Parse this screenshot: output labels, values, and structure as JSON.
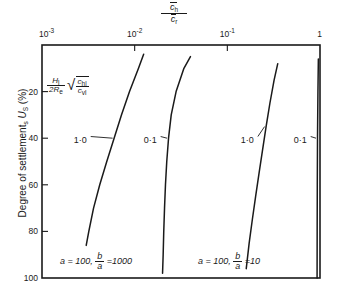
{
  "chart_data": {
    "type": "line",
    "title": "",
    "xlabel": "c̄h / c̄r",
    "xlabel_parts": {
      "numerator": "ch",
      "denominator": "cr"
    },
    "ylabel": "Degree of settlement, Us (%)",
    "x_scale": "log",
    "xlim": [
      0.001,
      1
    ],
    "ylim": [
      0,
      100
    ],
    "y_inverted": true,
    "grid": false,
    "legend": "none",
    "x_ticks": [
      {
        "value": 0.001,
        "label": "10",
        "exp": "-3"
      },
      {
        "value": 0.01,
        "label": "10",
        "exp": "-2"
      },
      {
        "value": 0.1,
        "label": "10",
        "exp": "-1"
      },
      {
        "value": 1,
        "label": "1",
        "exp": ""
      }
    ],
    "y_ticks": [
      {
        "value": 20,
        "label": "20"
      },
      {
        "value": 40,
        "label": "40"
      },
      {
        "value": 60,
        "label": "60"
      },
      {
        "value": 80,
        "label": "80"
      },
      {
        "value": 100,
        "label": "100"
      }
    ],
    "parameter_label": {
      "numerator": "H1",
      "denominator": "2Re",
      "radical": "√",
      "radicand_numerator": "chl",
      "radicand_denominator": "cvl"
    },
    "series": [
      {
        "name": "1·0",
        "label": "1·0",
        "group": "a = 100, b/a = 1000",
        "points": [
          {
            "x": 0.003,
            "y": 86
          },
          {
            "x": 0.0032,
            "y": 80
          },
          {
            "x": 0.0036,
            "y": 70
          },
          {
            "x": 0.0042,
            "y": 60
          },
          {
            "x": 0.005,
            "y": 50
          },
          {
            "x": 0.006,
            "y": 40
          },
          {
            "x": 0.0072,
            "y": 30
          },
          {
            "x": 0.0088,
            "y": 20
          },
          {
            "x": 0.011,
            "y": 10
          },
          {
            "x": 0.0125,
            "y": 4
          }
        ]
      },
      {
        "name": "0·1",
        "label": "0·1",
        "group": "a = 100, b/a = 1000",
        "points": [
          {
            "x": 0.02,
            "y": 98
          },
          {
            "x": 0.0203,
            "y": 90
          },
          {
            "x": 0.0206,
            "y": 80
          },
          {
            "x": 0.021,
            "y": 70
          },
          {
            "x": 0.0215,
            "y": 60
          },
          {
            "x": 0.0222,
            "y": 50
          },
          {
            "x": 0.0232,
            "y": 40
          },
          {
            "x": 0.0248,
            "y": 30
          },
          {
            "x": 0.028,
            "y": 20
          },
          {
            "x": 0.034,
            "y": 10
          },
          {
            "x": 0.04,
            "y": 5
          }
        ]
      },
      {
        "name": "1·0",
        "label": "1·0",
        "group": "a = 100, b/a = 10",
        "points": [
          {
            "x": 0.16,
            "y": 96
          },
          {
            "x": 0.172,
            "y": 85
          },
          {
            "x": 0.186,
            "y": 75
          },
          {
            "x": 0.202,
            "y": 65
          },
          {
            "x": 0.22,
            "y": 55
          },
          {
            "x": 0.24,
            "y": 45
          },
          {
            "x": 0.262,
            "y": 35
          },
          {
            "x": 0.288,
            "y": 25
          },
          {
            "x": 0.32,
            "y": 15
          },
          {
            "x": 0.35,
            "y": 8
          }
        ]
      },
      {
        "name": "0·1",
        "label": "0·1",
        "group": "a = 100, b/a = 10",
        "points": [
          {
            "x": 0.93,
            "y": 100
          },
          {
            "x": 0.932,
            "y": 80
          },
          {
            "x": 0.935,
            "y": 60
          },
          {
            "x": 0.94,
            "y": 40
          },
          {
            "x": 0.95,
            "y": 20
          },
          {
            "x": 0.96,
            "y": 6
          }
        ]
      }
    ],
    "annotations": [
      {
        "text": "1·0",
        "x": 0.0022,
        "y": 41
      },
      {
        "text": "0·1",
        "x": 0.0125,
        "y": 41
      },
      {
        "text": "1·0",
        "x": 0.14,
        "y": 41
      },
      {
        "text": "0·1",
        "x": 0.52,
        "y": 41
      }
    ],
    "groups": [
      {
        "a_label": "a",
        "a_value": "100",
        "ratio_num": "b",
        "ratio_den": "a",
        "ratio_value": "1000"
      },
      {
        "a_label": "a",
        "a_value": "100",
        "ratio_num": "b",
        "ratio_den": "a",
        "ratio_value": "10"
      }
    ]
  },
  "axis": {
    "top_title_numerator": "ch",
    "top_title_denominator": "cr",
    "y_title": "Degree of settlement, Us (%)",
    "y_title_main": "Degree of settlement",
    "y_title_sub": "s",
    "y_title_var": "U",
    "y_title_unit": "(%)"
  },
  "colors": {
    "line": "#1a1a1a",
    "axis": "#1a1a1a",
    "background": "#ffffff"
  }
}
